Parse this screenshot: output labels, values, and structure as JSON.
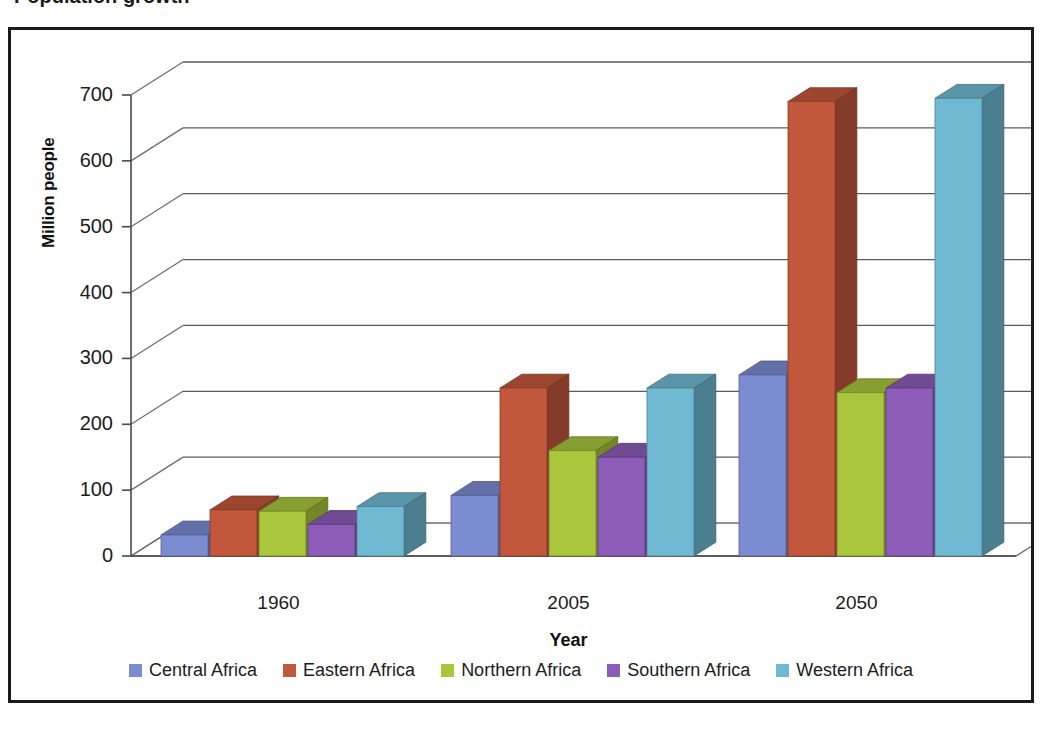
{
  "title_fragment": "Population growth",
  "chart_data": {
    "type": "bar",
    "title": "",
    "xlabel": "Year",
    "ylabel": "Million people",
    "categories": [
      "1960",
      "2005",
      "2050"
    ],
    "ylim": [
      0,
      700
    ],
    "yticks": [
      0,
      100,
      200,
      300,
      400,
      500,
      600,
      700
    ],
    "ytick_labels": [
      "0",
      "100",
      "200",
      "300",
      "400",
      "500",
      "600",
      "700"
    ],
    "grid": true,
    "three_d": true,
    "legend_position": "bottom",
    "series": [
      {
        "name": "Central Africa",
        "color": "#7b8cd1",
        "values": [
          32,
          92,
          275
        ]
      },
      {
        "name": "Eastern Africa",
        "color": "#c3573c",
        "values": [
          70,
          255,
          690
        ]
      },
      {
        "name": "Northern Africa",
        "color": "#a9c63c",
        "values": [
          68,
          160,
          248
        ]
      },
      {
        "name": "Southern Africa",
        "color": "#8c5cb8",
        "values": [
          48,
          150,
          255
        ]
      },
      {
        "name": "Western Africa",
        "color": "#6fb9d3",
        "values": [
          75,
          255,
          695
        ]
      }
    ]
  }
}
